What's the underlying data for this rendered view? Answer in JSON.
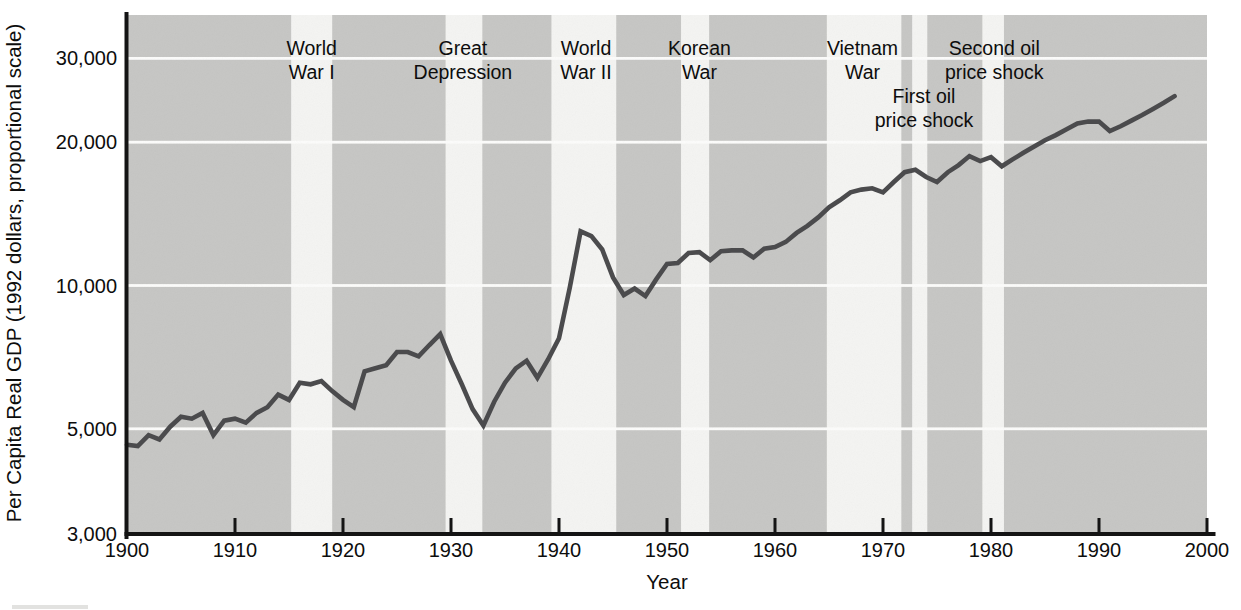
{
  "figure_title": "Per capita real GDP growth with historical event bands",
  "colors": {
    "plot_background": "#c6c6c4",
    "event_band": "#f4f4f2",
    "gridline": "#fcfcfb",
    "series_line": "#4b4b4d",
    "axis": "#141414",
    "text": "#0d0d0d"
  },
  "chart_data": {
    "type": "line",
    "title": "",
    "xlabel": "Year",
    "ylabel": "Per Capita Real GDP (1992 dollars, proportional scale)",
    "y_scale": "log",
    "x_range": [
      1900,
      2000
    ],
    "y_axis_bottom": 3000,
    "x_ticks": [
      1900,
      1910,
      1920,
      1930,
      1940,
      1950,
      1960,
      1970,
      1980,
      1990,
      2000
    ],
    "x_tick_labels": [
      "1900",
      "1910",
      "1920",
      "1930",
      "1940",
      "1950",
      "1960",
      "1970",
      "1980",
      "1990",
      "2000"
    ],
    "y_ticks": [
      30000,
      20000,
      10000,
      5000,
      3000
    ],
    "y_tick_labels": [
      "30,000",
      "20,000",
      "10,000",
      "5,000",
      "3,000"
    ],
    "grid": "horizontal white gridlines at labeled y ticks above 3,000",
    "legend": "none",
    "series": [
      {
        "name": "US per capita real GDP (1992 dollars)",
        "x": [
          1900,
          1901,
          1902,
          1903,
          1904,
          1905,
          1906,
          1907,
          1908,
          1909,
          1910,
          1911,
          1912,
          1913,
          1914,
          1915,
          1916,
          1917,
          1918,
          1919,
          1920,
          1921,
          1922,
          1923,
          1924,
          1925,
          1926,
          1927,
          1928,
          1929,
          1930,
          1931,
          1932,
          1933,
          1934,
          1935,
          1936,
          1937,
          1938,
          1939,
          1940,
          1941,
          1942,
          1943,
          1944,
          1945,
          1946,
          1947,
          1948,
          1949,
          1950,
          1951,
          1952,
          1953,
          1954,
          1955,
          1956,
          1957,
          1958,
          1959,
          1960,
          1961,
          1962,
          1963,
          1964,
          1965,
          1966,
          1967,
          1968,
          1969,
          1970,
          1971,
          1972,
          1973,
          1974,
          1975,
          1976,
          1977,
          1978,
          1979,
          1980,
          1981,
          1982,
          1983,
          1984,
          1985,
          1986,
          1987,
          1988,
          1989,
          1990,
          1991,
          1992,
          1993,
          1994,
          1995,
          1996,
          1997
        ],
        "y": [
          4630,
          4600,
          4850,
          4750,
          5050,
          5300,
          5250,
          5400,
          4850,
          5200,
          5250,
          5150,
          5400,
          5550,
          5900,
          5750,
          6250,
          6200,
          6300,
          6000,
          5750,
          5550,
          6600,
          6700,
          6800,
          7250,
          7250,
          7100,
          7500,
          7900,
          6950,
          6200,
          5500,
          5080,
          5700,
          6250,
          6700,
          6950,
          6400,
          7000,
          7750,
          9900,
          13000,
          12700,
          11900,
          10400,
          9550,
          9850,
          9500,
          10300,
          11100,
          11150,
          11700,
          11750,
          11300,
          11800,
          11850,
          11850,
          11450,
          11950,
          12050,
          12350,
          12900,
          13350,
          13900,
          14600,
          15100,
          15700,
          15900,
          16000,
          15700,
          16500,
          17300,
          17500,
          16900,
          16500,
          17300,
          17900,
          18700,
          18250,
          18600,
          17800,
          18400,
          19000,
          19600,
          20200,
          20700,
          21300,
          21900,
          22100,
          22100,
          21100,
          21600,
          22200,
          22800,
          23500,
          24200,
          25000
        ]
      }
    ],
    "event_bands": [
      {
        "id": "world-war-i",
        "label_lines": [
          "World",
          "War I"
        ],
        "start": 1915.2,
        "end": 1919.0,
        "label_year": 1917.1,
        "label_row": "top"
      },
      {
        "id": "great-depression",
        "label_lines": [
          "Great",
          "Depression"
        ],
        "start": 1929.5,
        "end": 1932.9,
        "label_year": 1931.1,
        "label_row": "top"
      },
      {
        "id": "world-war-ii",
        "label_lines": [
          "World",
          "War II"
        ],
        "start": 1939.3,
        "end": 1945.3,
        "label_year": 1942.5,
        "label_row": "top"
      },
      {
        "id": "korean-war",
        "label_lines": [
          "Korean",
          "War"
        ],
        "start": 1951.3,
        "end": 1953.9,
        "label_year": 1953.0,
        "label_row": "top"
      },
      {
        "id": "vietnam-war",
        "label_lines": [
          "Vietnam",
          "War"
        ],
        "start": 1964.8,
        "end": 1971.7,
        "label_year": 1968.1,
        "label_row": "top"
      },
      {
        "id": "first-oil-price-shock",
        "label_lines": [
          "First oil",
          "price shock"
        ],
        "start": 1972.7,
        "end": 1974.1,
        "label_year": 1973.8,
        "label_row": "mid"
      },
      {
        "id": "second-oil-price-shock",
        "label_lines": [
          "Second oil",
          "price shock"
        ],
        "start": 1979.2,
        "end": 1981.2,
        "label_year": 1980.3,
        "label_row": "top"
      }
    ]
  }
}
